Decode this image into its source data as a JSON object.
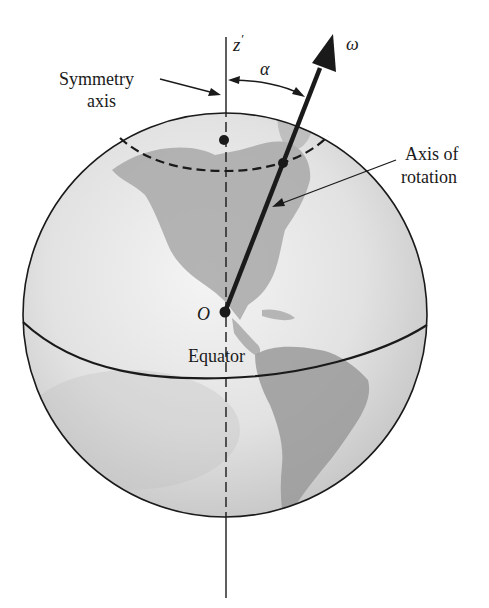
{
  "labels": {
    "z_axis": "z",
    "z_prime": "′",
    "omega": "ω",
    "alpha": "α",
    "symmetry_line1": "Symmetry",
    "symmetry_line2": "axis",
    "rotation_line1": "Axis of",
    "rotation_line2": "rotation",
    "origin": "O",
    "equator": "Equator"
  },
  "colors": {
    "ink": "#1a1a1a",
    "globe_light": "#f2f2f2",
    "globe_mid": "#d4d4d4",
    "globe_dark": "#b8b8b8",
    "land": "#9a9a9a"
  }
}
